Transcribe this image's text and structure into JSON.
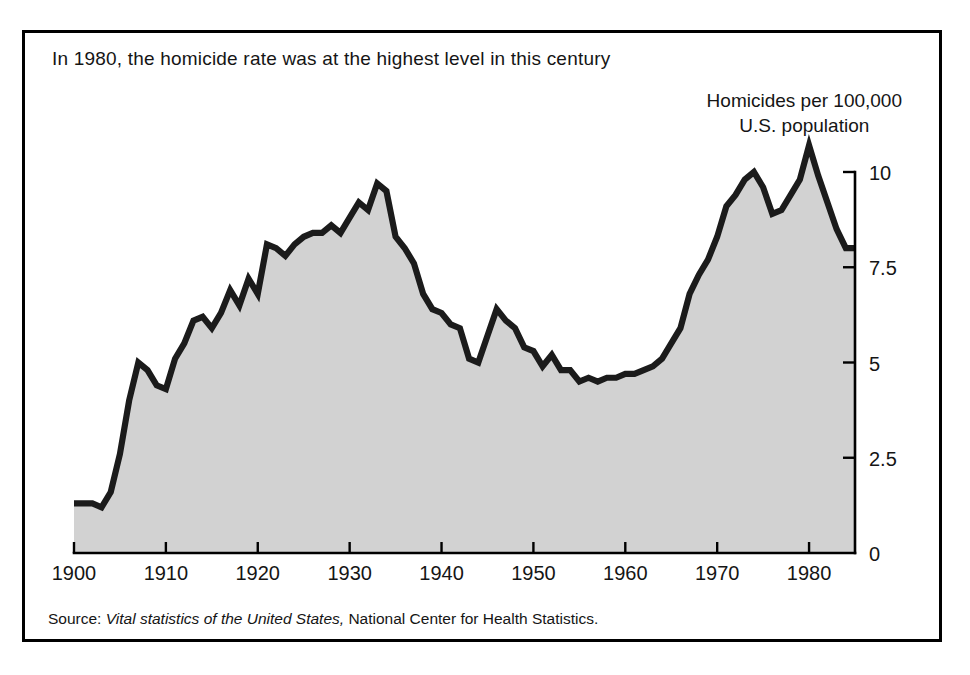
{
  "figure": {
    "title": "In 1980, the homicide rate was at the highest level in this century",
    "y_axis_caption_line1": "Homicides per 100,000",
    "y_axis_caption_line2": "U.S. population",
    "source_prefix": "Source:",
    "source_italic": "Vital statistics of the United States,",
    "source_rest": "National Center for Health Statistics.",
    "colors": {
      "area_fill": "#d2d2d2",
      "line": "#1b1b1b",
      "frame": "#000000",
      "text": "#151515",
      "background": "#ffffff"
    }
  },
  "chart_data": {
    "type": "area",
    "title": "In 1980, the homicide rate was at the highest level in this century",
    "subtitle": "",
    "xlabel": "",
    "ylabel": "Homicides per 100,000 U.S. population",
    "xlim": [
      1900,
      1985
    ],
    "ylim": [
      0,
      10.8
    ],
    "grid": false,
    "legend": "none",
    "y_ticks": [
      0,
      2.5,
      5,
      7.5,
      10
    ],
    "y_tick_labels": [
      "0",
      "2.5",
      "5",
      "7.5",
      "10"
    ],
    "y_axis_position": "right",
    "x_ticks": [
      1900,
      1910,
      1920,
      1930,
      1940,
      1950,
      1960,
      1970,
      1980
    ],
    "x_tick_labels": [
      "1900",
      "1910",
      "1920",
      "1930",
      "1940",
      "1950",
      "1960",
      "1970",
      "1980"
    ],
    "series": [
      {
        "name": "Homicide rate per 100,000 U.S. population",
        "x": [
          1900,
          1901,
          1902,
          1903,
          1904,
          1905,
          1906,
          1907,
          1908,
          1909,
          1910,
          1911,
          1912,
          1913,
          1914,
          1915,
          1916,
          1917,
          1918,
          1919,
          1920,
          1921,
          1922,
          1923,
          1924,
          1925,
          1926,
          1927,
          1928,
          1929,
          1930,
          1931,
          1932,
          1933,
          1934,
          1935,
          1936,
          1937,
          1938,
          1939,
          1940,
          1941,
          1942,
          1943,
          1944,
          1945,
          1946,
          1947,
          1948,
          1949,
          1950,
          1951,
          1952,
          1953,
          1954,
          1955,
          1956,
          1957,
          1958,
          1959,
          1960,
          1961,
          1962,
          1963,
          1964,
          1965,
          1966,
          1967,
          1968,
          1969,
          1970,
          1971,
          1972,
          1973,
          1974,
          1975,
          1976,
          1977,
          1978,
          1979,
          1980,
          1981,
          1982,
          1983,
          1984,
          1985
        ],
        "values": [
          1.3,
          1.3,
          1.3,
          1.2,
          1.6,
          2.6,
          4.0,
          5.0,
          4.8,
          4.4,
          4.3,
          5.1,
          5.5,
          6.1,
          6.2,
          5.9,
          6.3,
          6.9,
          6.5,
          7.2,
          6.8,
          8.1,
          8.0,
          7.8,
          8.1,
          8.3,
          8.4,
          8.4,
          8.6,
          8.4,
          8.8,
          9.2,
          9.0,
          9.7,
          9.5,
          8.3,
          8.0,
          7.6,
          6.8,
          6.4,
          6.3,
          6.0,
          5.9,
          5.1,
          5.0,
          5.7,
          6.4,
          6.1,
          5.9,
          5.4,
          5.3,
          4.9,
          5.2,
          4.8,
          4.8,
          4.5,
          4.6,
          4.5,
          4.6,
          4.6,
          4.7,
          4.7,
          4.8,
          4.9,
          5.1,
          5.5,
          5.9,
          6.8,
          7.3,
          7.7,
          8.3,
          9.1,
          9.4,
          9.8,
          10.0,
          9.6,
          8.9,
          9.0,
          9.4,
          9.8,
          10.7,
          9.9,
          9.2,
          8.5,
          8.0,
          8.0
        ]
      }
    ],
    "annotations": [
      {
        "text": "Peak 1933",
        "year": 1933,
        "value": 9.7
      },
      {
        "text": "WWII low 1944",
        "year": 1944,
        "value": 5.0
      },
      {
        "text": "Post-war spike 1946",
        "year": 1946,
        "value": 6.4
      },
      {
        "text": "Mid-1950s trough",
        "year": 1955,
        "value": 4.5
      },
      {
        "text": "Highest level 1980",
        "year": 1980,
        "value": 10.7
      }
    ]
  }
}
